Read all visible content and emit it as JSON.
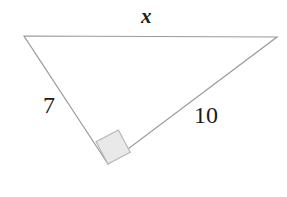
{
  "figure": {
    "name": "right-triangle-diagram",
    "background_color": "#ffffff",
    "width": 287,
    "height": 197,
    "stroke_color": "#9a9a9a",
    "stroke_width": 1.2,
    "label_color": "#1c1c1c",
    "right_angle_marker": {
      "name": "right-angle-square",
      "fill_color": "#e9e9e9",
      "stroke_color": "#b4b4b4",
      "points": "108,164 96.1,141.8 118.4,130.0 130.3,152.2"
    },
    "vertices": {
      "top_left": {
        "x": 24,
        "y": 36
      },
      "top_right": {
        "x": 277,
        "y": 37
      },
      "bottom": {
        "x": 108,
        "y": 164
      }
    },
    "polygon_points": "24,36 277,37 108,164",
    "labels": {
      "hypotenuse": "x",
      "leg_a": "7",
      "leg_b": "10"
    }
  },
  "chart_data": {
    "type": "diagram",
    "title": "",
    "shape": "right triangle",
    "sides": [
      {
        "name": "top-side-hypotenuse",
        "label": "x",
        "known": false,
        "from": "top_left",
        "to": "top_right"
      },
      {
        "name": "left-leg",
        "label": "7",
        "known": true,
        "value": 7,
        "from": "top_left",
        "to": "bottom"
      },
      {
        "name": "right-leg",
        "label": "10",
        "known": true,
        "value": 10,
        "from": "bottom",
        "to": "top_right"
      }
    ],
    "right_angle_at": "bottom",
    "annotations": [
      "x",
      "7",
      "10"
    ]
  }
}
